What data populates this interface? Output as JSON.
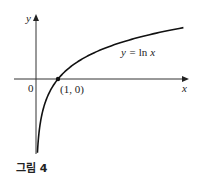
{
  "figure": {
    "caption": "그림 4",
    "axes": {
      "x_label": "x",
      "y_label": "y",
      "origin_label": "0"
    },
    "curve_label_prefix": "y = ",
    "curve_label_fn": "ln",
    "curve_label_var": " x",
    "point_label": "(1, 0)",
    "colors": {
      "curve": "#111111",
      "axis": "#333333",
      "point": "#111111"
    }
  },
  "chart_data": {
    "type": "line",
    "title": "",
    "xlabel": "x",
    "ylabel": "y",
    "function": "y = ln x",
    "annotations": [
      {
        "label": "(1, 0)",
        "x": 1,
        "y": 0
      }
    ],
    "x": [
      0.065,
      0.1,
      0.2,
      0.3,
      0.5,
      0.75,
      1,
      1.5,
      2,
      3,
      4,
      5,
      6,
      6.7
    ],
    "series": [
      {
        "name": "y = ln x",
        "values": [
          -2.73,
          -2.3,
          -1.61,
          -1.2,
          -0.69,
          -0.29,
          0,
          0.41,
          0.69,
          1.1,
          1.39,
          1.61,
          1.79,
          1.9
        ]
      }
    ],
    "grid": false,
    "legend": "none"
  }
}
